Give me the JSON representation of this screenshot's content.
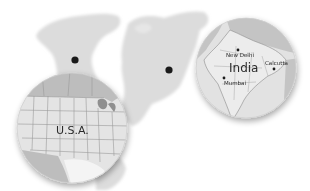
{
  "illustration": {
    "background": "#ffffff",
    "world_map_color": "#dcdcdc",
    "marker_color": "#1a1a1a",
    "markers": [
      {
        "name": "north-america-marker",
        "x": 75,
        "y": 60
      },
      {
        "name": "india-marker",
        "x": 169,
        "y": 70
      }
    ],
    "insets": [
      {
        "id": "usa",
        "label": "U.S.A.",
        "cx": 72,
        "cy": 128,
        "r": 55,
        "land_color": "#e6e6e6",
        "neighbor_color": "#bdbdbd"
      },
      {
        "id": "india",
        "label": "India",
        "cx": 246,
        "cy": 68,
        "r": 50,
        "land_color": "#e8e8e8",
        "neighbor_color": "#c4c4c4",
        "cities": [
          {
            "name": "New Delhi",
            "x": 238,
            "y": 50
          },
          {
            "name": "Mumbai",
            "x": 224,
            "y": 78
          },
          {
            "name": "Calcutta",
            "x": 273,
            "y": 67
          }
        ]
      }
    ]
  }
}
